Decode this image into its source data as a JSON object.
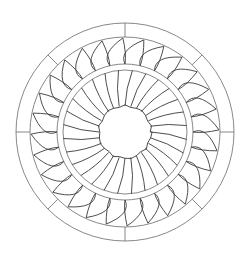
{
  "artwork": {
    "type": "mandala-line-art",
    "description": "Circular sunburst stained-glass pattern",
    "colors": {
      "background": "#ffffff",
      "line": "#6a6a6a",
      "petal_line": "#3a3a3a"
    },
    "center": [
      125,
      132
    ],
    "rings": {
      "outer": 109,
      "second": 95,
      "band_outer": 68,
      "band_inner": 62,
      "core": 26
    },
    "outer_dividers": 8,
    "inner_rays": 28,
    "flame_petals": 28
  }
}
